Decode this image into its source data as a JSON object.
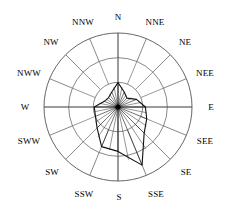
{
  "figure": {
    "name": "wind-rose-diagram",
    "type": "polar-rose",
    "background_color": "#ffffff",
    "line_color": "#555555",
    "data_line_color": "#111111",
    "center_dot_color": "#000000"
  },
  "labels": {
    "directions": [
      {
        "id": "n",
        "text": "N",
        "angle_deg": 0,
        "x": 118,
        "y": 17
      },
      {
        "id": "nne",
        "text": "NNE",
        "angle_deg": 22.5,
        "x": 155,
        "y": 22
      },
      {
        "id": "ne",
        "text": "NE",
        "angle_deg": 45,
        "x": 185,
        "y": 42
      },
      {
        "id": "nee",
        "text": "NEE",
        "angle_deg": 67.5,
        "x": 205,
        "y": 73
      },
      {
        "id": "e",
        "text": "E",
        "angle_deg": 90,
        "x": 211,
        "y": 107
      },
      {
        "id": "see",
        "text": "SEE",
        "angle_deg": 112.5,
        "x": 205,
        "y": 141
      },
      {
        "id": "se",
        "text": "SE",
        "angle_deg": 135,
        "x": 186,
        "y": 172
      },
      {
        "id": "sse",
        "text": "SSE",
        "angle_deg": 157.5,
        "x": 156,
        "y": 194
      },
      {
        "id": "s",
        "text": "S",
        "angle_deg": 180,
        "x": 119,
        "y": 197
      },
      {
        "id": "ssw",
        "text": "SSW",
        "angle_deg": 202.5,
        "x": 84,
        "y": 194
      },
      {
        "id": "sw",
        "text": "SW",
        "angle_deg": 225,
        "x": 52,
        "y": 172
      },
      {
        "id": "sww",
        "text": "SWW",
        "angle_deg": 247.5,
        "x": 29,
        "y": 141
      },
      {
        "id": "w",
        "text": "W",
        "angle_deg": 270,
        "x": 25,
        "y": 107
      },
      {
        "id": "nww",
        "text": "NWW",
        "angle_deg": 292.5,
        "x": 29,
        "y": 73
      },
      {
        "id": "nw",
        "text": "NW",
        "angle_deg": 315,
        "x": 51,
        "y": 42
      },
      {
        "id": "nnw",
        "text": "NNW",
        "angle_deg": 337.5,
        "x": 83,
        "y": 22
      }
    ]
  },
  "chart_data": {
    "type": "line",
    "subtype": "wind-rose-polar",
    "title": "",
    "xlabel": "",
    "ylabel": "",
    "grid": true,
    "legend": "none",
    "center": {
      "x": 118,
      "y": 107
    },
    "outer_radius_px": 74,
    "rings_fraction": [
      0.333,
      0.667,
      1.0
    ],
    "ring_radii_px": [
      24.7,
      49.3,
      74.0
    ],
    "rlim": [
      0,
      1
    ],
    "categories": [
      "N",
      "NNE",
      "NE",
      "NEE",
      "E",
      "SEE",
      "SE",
      "SSE",
      "S",
      "SSW",
      "SW",
      "SWW",
      "W",
      "NWW",
      "NW",
      "NNW"
    ],
    "angles_deg": [
      0,
      22.5,
      45,
      67.5,
      90,
      112.5,
      135,
      157.5,
      180,
      202.5,
      225,
      247.5,
      270,
      292.5,
      315,
      337.5
    ],
    "values": [
      0.33,
      0.22,
      0.17,
      0.27,
      0.37,
      0.42,
      0.5,
      0.85,
      0.6,
      0.58,
      0.4,
      0.33,
      0.32,
      0.2,
      0.18,
      0.22
    ],
    "values_px": [
      24.4,
      16.3,
      12.6,
      20.0,
      27.4,
      31.1,
      37.0,
      62.9,
      44.4,
      42.9,
      29.6,
      24.4,
      23.7,
      14.8,
      13.3,
      16.3
    ],
    "series": [
      {
        "name": "wind frequency",
        "values": [
          0.33,
          0.22,
          0.17,
          0.27,
          0.37,
          0.42,
          0.5,
          0.85,
          0.6,
          0.58,
          0.4,
          0.33,
          0.32,
          0.2,
          0.18,
          0.22
        ]
      }
    ],
    "spokes": 16,
    "spoke_style": "cardinal axes full diameter; intercardinal spokes drawn between middle and outer ring"
  }
}
